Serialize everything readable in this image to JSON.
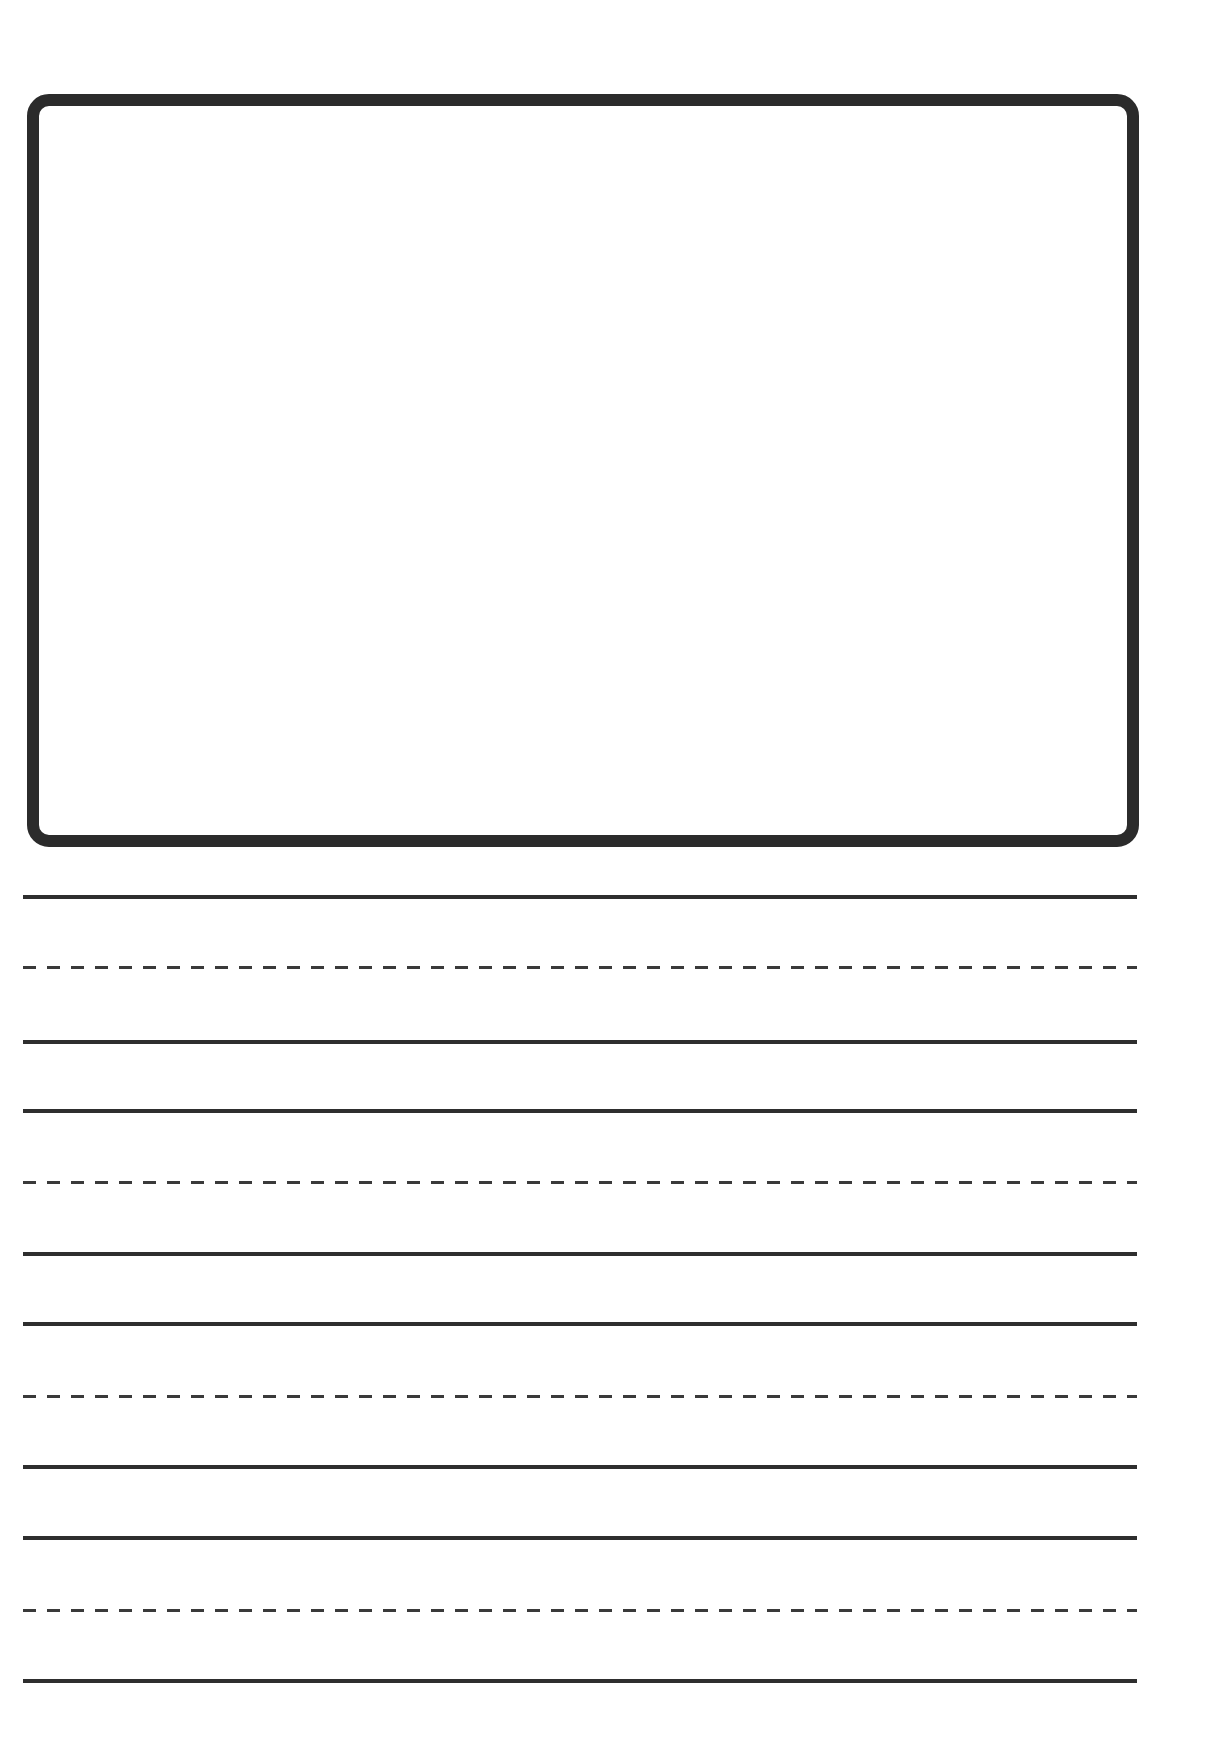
{
  "page": {
    "type": "primary writing paper",
    "background": "#ffffff",
    "ink_color": "#2b2b2b"
  },
  "drawing_box": {
    "label": "",
    "border_color": "#2b2b2b"
  },
  "writing_lines": [
    {
      "style": "solid",
      "y": 897
    },
    {
      "style": "dashed",
      "y": 967
    },
    {
      "style": "solid",
      "y": 1042
    },
    {
      "style": "solid",
      "y": 1111
    },
    {
      "style": "dashed",
      "y": 1182
    },
    {
      "style": "solid",
      "y": 1254
    },
    {
      "style": "solid",
      "y": 1324
    },
    {
      "style": "dashed",
      "y": 1396
    },
    {
      "style": "solid",
      "y": 1467
    },
    {
      "style": "solid",
      "y": 1538
    },
    {
      "style": "dashed",
      "y": 1610
    },
    {
      "style": "solid",
      "y": 1681
    }
  ]
}
